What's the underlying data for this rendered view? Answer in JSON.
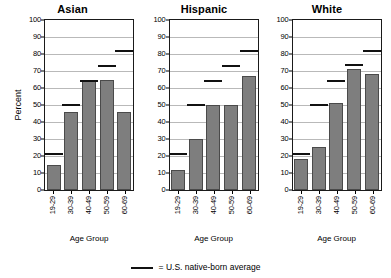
{
  "chart_data": {
    "type": "bar",
    "title": "",
    "xlabel": "Age Group",
    "ylabel": "Percent",
    "ylim": [
      0,
      100
    ],
    "ytick_step": 10,
    "grid": true,
    "legend_position": "bottom-center",
    "categories": [
      "19-29",
      "30-39",
      "40-49",
      "50-59",
      "60-69"
    ],
    "panels": [
      {
        "title": "Asian",
        "values": [
          15,
          46,
          64.5,
          64.5,
          46
        ],
        "reference_values": [
          21,
          50,
          64,
          73,
          81.5
        ]
      },
      {
        "title": "Hispanic",
        "values": [
          11.5,
          30,
          50,
          50,
          67
        ],
        "reference_values": [
          21,
          50,
          64,
          73,
          81.5
        ]
      },
      {
        "title": "White",
        "values": [
          18.5,
          25.5,
          51,
          71,
          68.5
        ],
        "reference_values": [
          21,
          50,
          64,
          73.5,
          81.5
        ]
      }
    ],
    "ytick_labels": [
      "0",
      "10",
      "20",
      "30",
      "40",
      "50",
      "60",
      "70",
      "80",
      "90",
      "100"
    ],
    "legend": [
      {
        "marker": "line",
        "text": "= U.S. native-born average",
        "color": "#111111"
      }
    ],
    "colors": {
      "bar_fill": "#7e7e7e",
      "bar_stroke": "#4a4a4a",
      "reference_line": "#111111",
      "grid": "#b9b9b9",
      "axis": "#1a1a1a",
      "background": "#ffffff"
    }
  }
}
